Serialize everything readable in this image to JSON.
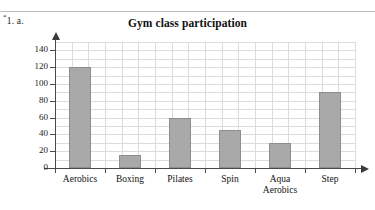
{
  "page": {
    "question_marker": "1. a.",
    "question_marker_star": "*"
  },
  "chart_data": {
    "type": "bar",
    "title": "Gym class participation",
    "categories": [
      "Aerobics",
      "Boxing",
      "Pilates",
      "Spin",
      "Aqua Aerobics",
      "Step"
    ],
    "category_lines": [
      [
        "Aerobics"
      ],
      [
        "Boxing"
      ],
      [
        "Pilates"
      ],
      [
        "Spin"
      ],
      [
        "Aqua",
        "Aerobics"
      ],
      [
        "Step"
      ]
    ],
    "values": [
      120,
      15,
      60,
      45,
      30,
      90
    ],
    "xlabel": "",
    "ylabel": "",
    "ylim": [
      0,
      150
    ],
    "yticks": [
      0,
      20,
      40,
      60,
      80,
      100,
      120,
      140
    ],
    "ytick_labels": [
      "0",
      "20",
      "40",
      "60",
      "80",
      "100",
      "120",
      "140"
    ],
    "grid": true,
    "legend": false,
    "bar_color": "#a9a9a9",
    "bar_border_color": "#8d8d8d",
    "grid_color": "#dcdcdc",
    "axis_color": "#4a4a4a"
  }
}
